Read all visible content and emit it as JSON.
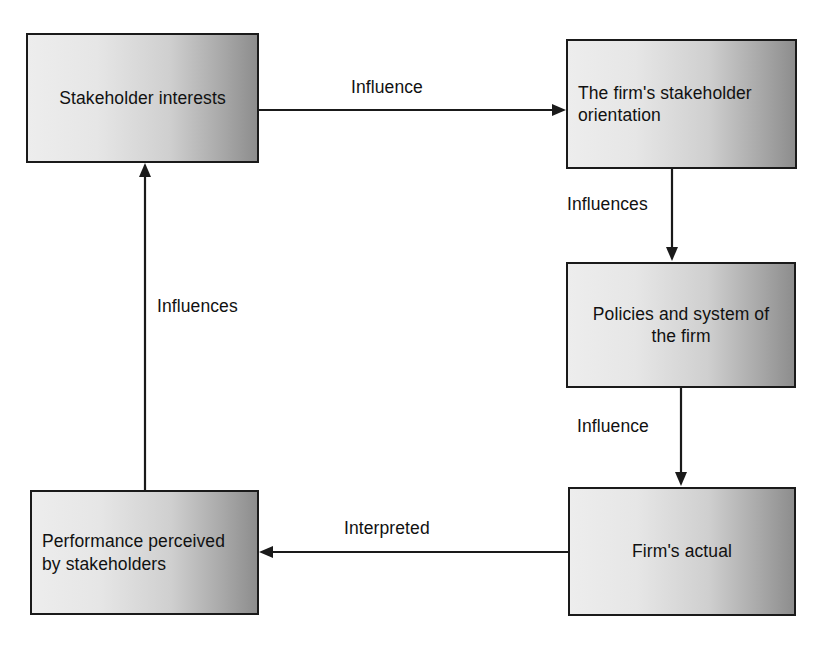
{
  "diagram": {
    "type": "cycle-flow-diagram",
    "width": 820,
    "height": 648,
    "background_color": "#ffffff",
    "box_border_color": "#1a1a1a",
    "box_fill_light": "#ededed",
    "box_fill_dark": "#8d8d8d",
    "text_color": "#111111",
    "nodes": [
      {
        "id": "stakeholder-interests",
        "label": "Stakeholder interests",
        "align": "center",
        "x": 26,
        "y": 33,
        "w": 233,
        "h": 130
      },
      {
        "id": "firm-stakeholder-orientation",
        "label": "The firm's stakeholder\norientation",
        "align": "left",
        "x": 566,
        "y": 39,
        "w": 231,
        "h": 130
      },
      {
        "id": "policies-system",
        "label": "Policies and system of\nthe firm",
        "align": "center",
        "x": 566,
        "y": 262,
        "w": 230,
        "h": 126
      },
      {
        "id": "firms-actual",
        "label": "Firm's actual",
        "align": "center",
        "x": 568,
        "y": 487,
        "w": 228,
        "h": 129
      },
      {
        "id": "performance-perceived",
        "label": "Performance perceived\nby stakeholders",
        "align": "left",
        "x": 30,
        "y": 490,
        "w": 229,
        "h": 125
      }
    ],
    "edges": [
      {
        "id": "stakeholder-interests-to-orientation",
        "label": "Influence",
        "from": "stakeholder-interests",
        "to": "firm-stakeholder-orientation",
        "direction": "right"
      },
      {
        "id": "orientation-to-policies",
        "label": "Influences",
        "from": "firm-stakeholder-orientation",
        "to": "policies-system",
        "direction": "down"
      },
      {
        "id": "policies-to-firms-actual",
        "label": "Influence",
        "from": "policies-system",
        "to": "firms-actual",
        "direction": "down"
      },
      {
        "id": "firms-actual-to-performance",
        "label": "Interpreted",
        "from": "firms-actual",
        "to": "performance-perceived",
        "direction": "left"
      },
      {
        "id": "performance-to-stakeholder-interests",
        "label": "Influences",
        "from": "performance-perceived",
        "to": "stakeholder-interests",
        "direction": "up"
      }
    ]
  }
}
